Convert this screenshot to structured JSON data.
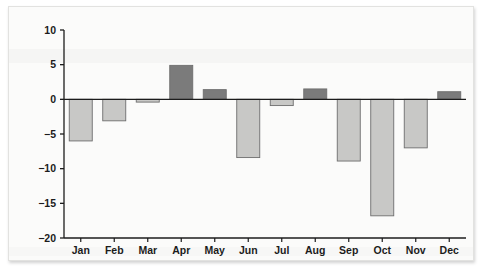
{
  "chart_data": {
    "type": "bar",
    "title": "",
    "subtitle": "",
    "xlabel": "",
    "ylabel": "",
    "categories": [
      "Jan",
      "Feb",
      "Mar",
      "Apr",
      "May",
      "Jun",
      "Jul",
      "Aug",
      "Sep",
      "Oct",
      "Nov",
      "Dec"
    ],
    "values": [
      -6.0,
      -3.1,
      -0.4,
      4.9,
      1.4,
      -8.4,
      -0.9,
      1.5,
      -8.9,
      -16.8,
      -7.0,
      1.1
    ],
    "series": [
      {
        "name": "Monthly value",
        "values": [
          -6.0,
          -3.1,
          -0.4,
          4.9,
          1.4,
          -8.4,
          -0.9,
          1.5,
          -8.9,
          -16.8,
          -7.0,
          1.1
        ]
      }
    ],
    "ylim": [
      -20,
      10
    ],
    "yticks": [
      10,
      5,
      0,
      -5,
      -10,
      -15,
      -20
    ],
    "ytick_labels": [
      "10",
      "5",
      "0",
      "-5",
      "-10",
      "-15",
      "-20"
    ],
    "grid": false,
    "legend": false,
    "legend_position": "none",
    "colors": {
      "positive_bar_fill": "#7b7b7b",
      "negative_bar_fill": "#c8c8c6",
      "bar_stroke": "#6e6e6e",
      "axis": "#1c1c1c",
      "text": "#1c1c1c",
      "panel_background": "#fbfbfa",
      "panel_border": "#e2e2e0"
    }
  }
}
